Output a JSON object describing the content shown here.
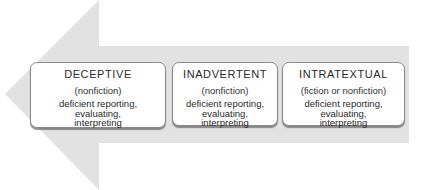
{
  "diagram": {
    "arrow": {
      "direction": "left",
      "color": "#e2e2e2"
    },
    "boxes": [
      {
        "title": "DECEPTIVE",
        "subtitle": "(nonfiction)",
        "desc_lines": [
          "deficient reporting,",
          "evaluating,",
          "interpreting"
        ]
      },
      {
        "title": "INADVERTENT",
        "subtitle": "(nonfiction)",
        "desc_lines": [
          "deficient reporting,",
          "evaluating,",
          "interpreting"
        ]
      },
      {
        "title": "INTRATEXTUAL",
        "subtitle": "(fiction or nonfiction)",
        "desc_lines": [
          "deficient reporting,",
          "evaluating,",
          "interpreting"
        ]
      }
    ]
  }
}
